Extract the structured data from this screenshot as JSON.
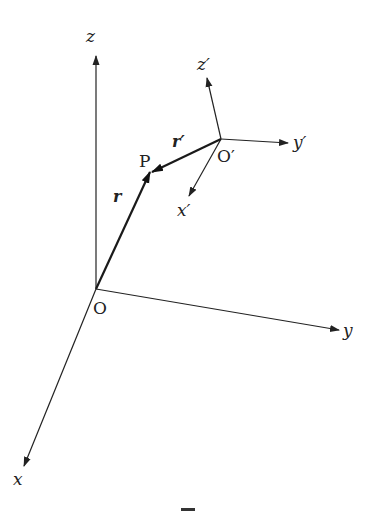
{
  "figure": {
    "colors": {
      "ink": "#222222",
      "background": "#ffffff"
    },
    "frames": [
      {
        "name": "O",
        "origin_label": "O",
        "axes": [
          {
            "label": "x",
            "direction": "down-left"
          },
          {
            "label": "y",
            "direction": "right"
          },
          {
            "label": "z",
            "direction": "up"
          }
        ]
      },
      {
        "name": "O'",
        "origin_label": "O′",
        "axes": [
          {
            "label": "x′",
            "direction": "down-left"
          },
          {
            "label": "y′",
            "direction": "right"
          },
          {
            "label": "z′",
            "direction": "up-left"
          }
        ]
      }
    ],
    "point": {
      "label": "P"
    },
    "vectors": [
      {
        "label": "r",
        "from": "O",
        "to": "P"
      },
      {
        "label": "r′",
        "from": "O′",
        "to": "P"
      }
    ]
  }
}
